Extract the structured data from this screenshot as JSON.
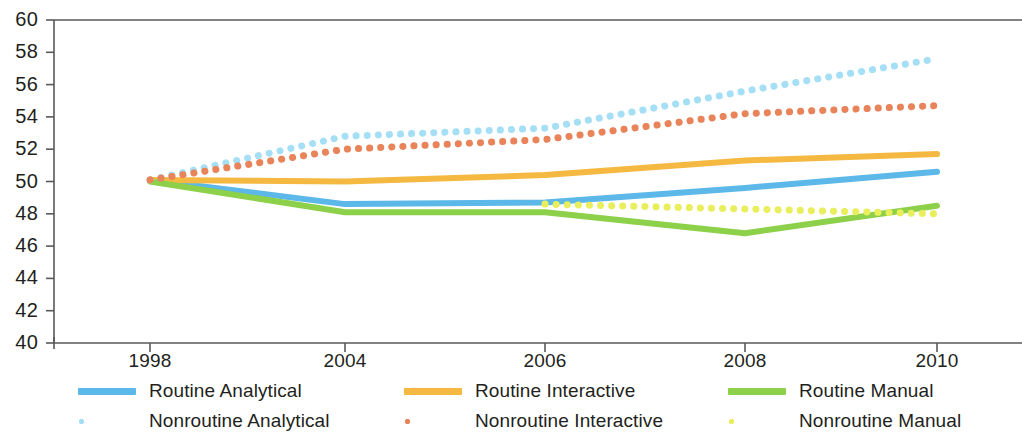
{
  "chart_data": {
    "type": "line",
    "title": "",
    "xlabel": "",
    "ylabel": "",
    "x": [
      1998,
      2004,
      2006,
      2008,
      2010
    ],
    "xtick_labels": [
      "1998",
      "2004",
      "2006",
      "2008",
      "2010"
    ],
    "ylim": [
      40,
      60
    ],
    "ytick_labels": [
      "60",
      "58",
      "56",
      "54",
      "52",
      "50",
      "48",
      "46",
      "44",
      "42",
      "40"
    ],
    "yticks": [
      60,
      58,
      56,
      54,
      52,
      50,
      48,
      46,
      44,
      42,
      40
    ],
    "grid": false,
    "legend_position": "bottom",
    "series": [
      {
        "name": "Routine Analytical",
        "style": "solid",
        "color": "#5BB8E8",
        "values": [
          50.1,
          48.6,
          48.7,
          49.6,
          50.6
        ]
      },
      {
        "name": "Routine Interactive",
        "style": "solid",
        "color": "#F5B942",
        "values": [
          50.1,
          50.0,
          50.4,
          51.3,
          51.7
        ]
      },
      {
        "name": "Routine Manual",
        "style": "solid",
        "color": "#8DD04A",
        "values": [
          50.0,
          48.1,
          48.1,
          46.8,
          48.5
        ]
      },
      {
        "name": "Nonroutine Analytical",
        "style": "dotted",
        "color": "#A5DFF5",
        "values": [
          50.1,
          52.8,
          53.3,
          55.6,
          57.6
        ]
      },
      {
        "name": "Nonroutine Interactive",
        "style": "dotted",
        "color": "#E8835A",
        "values": [
          50.1,
          52.0,
          52.6,
          54.2,
          54.7
        ]
      },
      {
        "name": "Nonroutine Manual",
        "style": "dotted",
        "color": "#E8EE5C",
        "values": [
          null,
          null,
          48.6,
          48.3,
          48.0
        ]
      }
    ]
  },
  "legend": {
    "items": [
      {
        "label": "Routine Analytical",
        "color": "#5BB8E8",
        "style": "solid"
      },
      {
        "label": "Routine Interactive",
        "color": "#F5B942",
        "style": "solid"
      },
      {
        "label": "Routine Manual",
        "color": "#8DD04A",
        "style": "solid"
      },
      {
        "label": "Nonroutine Analytical",
        "color": "#A5DFF5",
        "style": "dotted"
      },
      {
        "label": "Nonroutine Interactive",
        "color": "#E8835A",
        "style": "dotted"
      },
      {
        "label": "Nonroutine Manual",
        "color": "#E8EE5C",
        "style": "dotted"
      }
    ]
  },
  "axes": {
    "axis_color": "#58595b",
    "background": "#ffffff"
  }
}
